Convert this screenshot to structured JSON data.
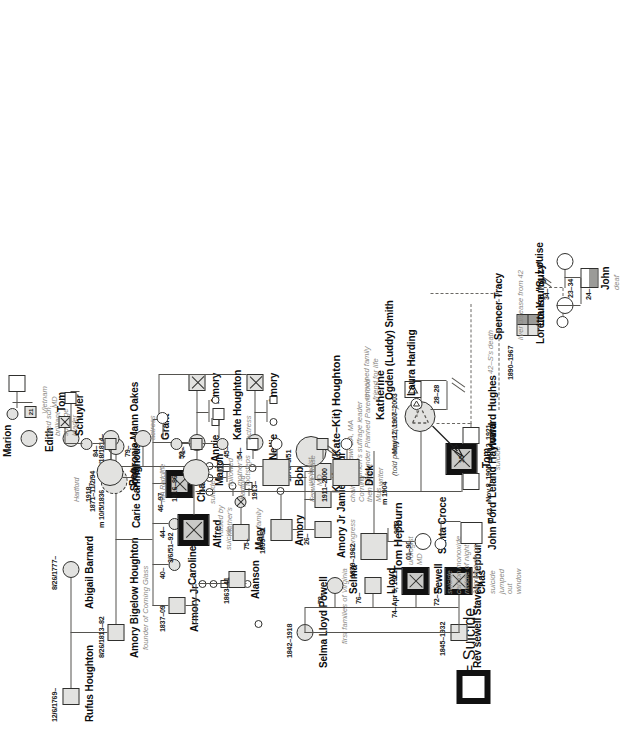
{
  "document": {
    "type": "genogram",
    "subject": "Katharine Hepburn family genealogy chart",
    "legend": {
      "symbol_label": "= Suicide"
    }
  },
  "generation1": {
    "rufus": {
      "name": "Rufus Houghton",
      "dates": "12/6/1769–"
    },
    "abigail": {
      "name": "Abigail Barnard",
      "dates": "8/26/1777–"
    }
  },
  "generation2": {
    "amory_bigelow": {
      "name": "Amory Bigelow Houghton",
      "note": "founder of Corning Glass",
      "dates": "8/26/1813–82",
      "marriage": "m 10/5/1836"
    },
    "sophronia": {
      "name": "Sophronia Mann Oakes",
      "dates": "2/18/1814–"
    }
  },
  "generation3": {
    "armory_jr": {
      "name": "Armory Jr",
      "dates": "1837–09"
    },
    "caroline": {
      "name": "Caroline",
      "age": "40–"
    },
    "kath": {
      "name": "Kath",
      "age": "44–"
    },
    "chas": {
      "name": "Chas",
      "note": "suicide",
      "age": "46–97"
    },
    "annie": {
      "name": "Annie",
      "age": "52–"
    },
    "nellie": {
      "name": "Nellie",
      "age": "54–"
    },
    "amory_spouse_annie": {
      "name": "Amory"
    },
    "amory_spouse_nellie": {
      "name": "Amory"
    }
  },
  "generation4": {
    "alanson": {
      "name": "Alanson",
      "dates": "1863–41"
    },
    "alfred": {
      "name": "Alfred",
      "note": "suicide",
      "dates": "3/6/51–92"
    },
    "carie": {
      "name": "Carie Garlinghouse",
      "dates": "1871–11/2/94",
      "inner_label": "34"
    },
    "amory": {
      "name": "Amory",
      "dates": "1899–81"
    },
    "marion_top": {
      "name": "Marion",
      "inner_label": "21"
    }
  },
  "generation5": {
    "amory_jr_congress": {
      "name": "Amory Jr",
      "note": "congress",
      "age": "26–"
    },
    "jamie_arthur": {
      "name": "Jamie Arthur",
      "note": "chair\nCorning\nthen of Met\nMus"
    },
    "mary": {
      "name": "Mary",
      "note_left": "raised by\nmother's",
      "note_right": "family",
      "age": "75–"
    },
    "kathy": {
      "name": "Kathy (Kate–Kit) Houghton",
      "dates": "1878–3/51",
      "note": "Bryn Mawr BA, MA\nwomen's suffrage leader\ncofounder Planned Parenthood"
    },
    "edith": {
      "name": "Edith",
      "note": "med sch,\nbrilliant\nsuffrage\nleader",
      "spouse_note": "MD"
    },
    "marion": {
      "name": "Marion"
    },
    "sister_79": {
      "age": "79–"
    },
    "sister_84": {
      "age": "84–"
    },
    "tom_hepburn": {
      "name": "Tom Hepburn",
      "note": "urologist\nMD",
      "dates": "1879–1962",
      "marriage": "m 1904"
    },
    "rev_sewell": {
      "name": "Rev sewell Stavely Hepburn",
      "dates": "1845–1932"
    },
    "selma_lloyd_powell": {
      "name": "Selma Lloyd Powell",
      "dates": "1842–1918",
      "note": "first families of Virginia"
    }
  },
  "hepburn_siblings": {
    "chas": {
      "name": "Chas",
      "note": "suicide\njumped\nout\nwindow",
      "age": "72–15"
    },
    "sewell": {
      "name": "Sewell",
      "note": "suicide\ncarbon monoxide\nmiddle of night\n\"working on car\"",
      "dates": "74–Apr 5, 1921"
    },
    "lloyd": {
      "name": "Lloyd",
      "age": "76–"
    },
    "selma": {
      "name": "Selma",
      "age": "78–"
    },
    "santa_croce": {
      "name": "Santa Croce",
      "dates": "01–90",
      "marriage": "9/52"
    }
  },
  "generation6": {
    "tom": {
      "name": "Tom",
      "note": "suicide",
      "dates": "Nov 8, 1905–Apr 2, 1921",
      "inner_label": "15"
    },
    "katherine": {
      "name": "Katherine",
      "dates": "May 12, 1907–2003",
      "note": "(told people \"Nov 8\")"
    },
    "dick": {
      "name": "Dick",
      "note": "writer",
      "dates": "1911–2000",
      "house": "Fenwick House"
    },
    "bob": {
      "name": "Bob",
      "note": "urologist\nMD",
      "dates": "1913–",
      "place": "Hartford"
    },
    "marion": {
      "name": "Marion",
      "note": "followed\nmother's\nfootsteps",
      "dates": "1916–86",
      "education": "MA Radcliffe"
    },
    "peg": {
      "name": "Peg",
      "dates": "1918–",
      "place": "Hartford"
    }
  },
  "generation7": {
    "kate_houghton": {
      "name": "Kate Houghton",
      "note": "actress",
      "age": "45–"
    },
    "grant": {
      "name": "Grant",
      "note": "actress",
      "age": "71–"
    },
    "schuyler": {
      "name": "Schuyler"
    },
    "tom_vietnam": {
      "name": "Tom",
      "note": "Vietnam"
    }
  },
  "katherine_relations": {
    "ogden_smith": {
      "name": "Ogden (Luddy) Smith",
      "note": "remained family\nfriend for life",
      "dates": "28–28"
    },
    "laura_harding": {
      "name": "Laura Harding"
    },
    "howard_hughes": {
      "name": "Howard Hughes"
    },
    "leland_hayward": {
      "name": "Leland Hayward"
    },
    "john_ford": {
      "name": "John Ford",
      "note": "m 42"
    },
    "spencer_tracy": {
      "name": "Spencer Tracy",
      "dates": "1890–1967",
      "note": "liver disease from 42",
      "relation_note": "42–S's death"
    },
    "loretta_young": {
      "name": "Loretta Young",
      "note": "34–"
    },
    "louise": {
      "name": "Louise",
      "note": "23–34"
    },
    "louise_suzy": {
      "name": "Louise \"Suzy\""
    },
    "john": {
      "name": "John",
      "note": "deaf",
      "age": "24–"
    }
  }
}
